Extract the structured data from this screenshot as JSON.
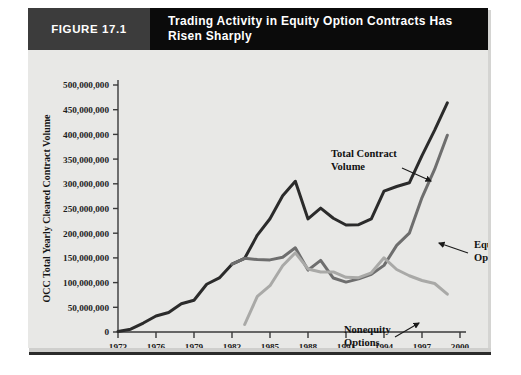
{
  "figure": {
    "tag": "FIGURE 17.1",
    "title": "Trading Activity in Equity Option Contracts Has Risen Sharply"
  },
  "chart_data": {
    "type": "line",
    "title": "Trading Activity in Equity Option Contracts Has Risen Sharply",
    "xlabel": "",
    "ylabel": "OCC Total Yearly Cleared Contract Volume",
    "xlim": [
      1973,
      2000
    ],
    "ylim": [
      0,
      500000000
    ],
    "xticks": [
      1973,
      1976,
      1979,
      1982,
      1985,
      1988,
      1991,
      1994,
      1997,
      2000
    ],
    "xtick_labels": [
      "1973",
      "1976",
      "1979",
      "1982",
      "1985",
      "1988",
      "1991",
      "1994",
      "1997",
      "2000"
    ],
    "yticks": [
      0,
      50000000,
      100000000,
      150000000,
      200000000,
      250000000,
      300000000,
      350000000,
      400000000,
      450000000,
      500000000
    ],
    "ytick_labels": [
      "0",
      "50,000,000",
      "100,000,000",
      "150,000,000",
      "200,000,000",
      "250,000,000",
      "300,000,000",
      "350,000,000",
      "400,000,000",
      "450,000,000",
      "500,000,000"
    ],
    "grid": false,
    "legend": "annotations",
    "series": [
      {
        "name": "Total Contract Volume",
        "color": "#2b2b2b",
        "width": 3.0,
        "x": [
          1973,
          1974,
          1975,
          1976,
          1977,
          1978,
          1979,
          1980,
          1981,
          1982,
          1983,
          1984,
          1985,
          1986,
          1987,
          1988,
          1989,
          1990,
          1991,
          1992,
          1993,
          1994,
          1995,
          1996,
          1997,
          1998,
          1999
        ],
        "y": [
          1100000,
          5700000,
          18100000,
          32400000,
          39600000,
          57200000,
          64300000,
          96700000,
          109400000,
          137300000,
          149200000,
          196200000,
          229200000,
          275800000,
          305200000,
          228900000,
          250800000,
          230200000,
          216500000,
          217200000,
          228800000,
          285100000,
          294600000,
          302000000,
          357100000,
          408700000,
          463900000
        ]
      },
      {
        "name": "Equity Options",
        "color": "#6e6e6e",
        "width": 3.0,
        "x": [
          1982,
          1983,
          1984,
          1985,
          1986,
          1987,
          1988,
          1989,
          1990,
          1991,
          1992,
          1993,
          1994,
          1995,
          1996,
          1997,
          1998,
          1999
        ],
        "y": [
          137300000,
          149100000,
          146600000,
          146000000,
          151300000,
          170400000,
          125300000,
          145100000,
          109300000,
          101000000,
          107500000,
          116600000,
          134900000,
          175300000,
          200100000,
          272100000,
          329600000,
          398400000
        ]
      },
      {
        "name": "Nonequity Options",
        "color": "#a9a9a7",
        "width": 3.0,
        "x": [
          1983,
          1984,
          1985,
          1986,
          1987,
          1988,
          1989,
          1990,
          1991,
          1992,
          1993,
          1994,
          1995,
          1996,
          1997,
          1998,
          1999
        ],
        "y": [
          15200000,
          72300000,
          93700000,
          134100000,
          160400000,
          127700000,
          121400000,
          121600000,
          110600000,
          110000000,
          119800000,
          150200000,
          126500000,
          113800000,
          104300000,
          98200000,
          76600000
        ]
      }
    ],
    "annotations": [
      {
        "text_line1": "Total Contract",
        "text_line2": "Volume",
        "label_x": 303,
        "label_y": 107,
        "leader": [
          [
            374,
            118
          ],
          [
            403,
            131
          ]
        ]
      },
      {
        "text_line1": "Equity",
        "text_line2": "Options",
        "label_x": 446,
        "label_y": 198,
        "leader": [
          [
            440,
            203
          ],
          [
            411,
            193
          ]
        ]
      },
      {
        "text_line1": "Nonequity",
        "text_line2": "Options",
        "label_x": 316,
        "label_y": 283,
        "leader": [
          [
            367,
            287
          ],
          [
            391,
            273
          ]
        ]
      }
    ]
  }
}
